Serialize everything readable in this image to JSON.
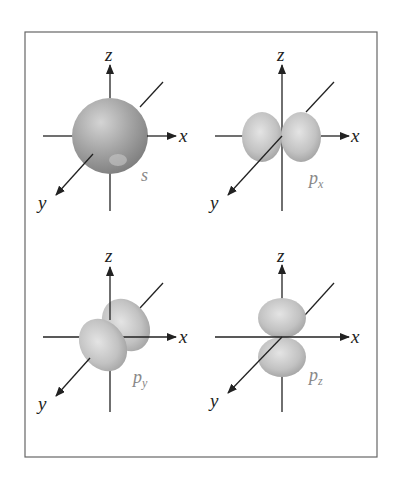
{
  "figure": {
    "type": "atomic-orbitals-diagram",
    "frame_color": "#666666",
    "axis_color": "#222222",
    "orbital_fill": "#b4b4b4",
    "orbital_highlight": "#e2e2e2",
    "orbital_shadow": "#8a8a8a",
    "label_color": "#888888",
    "panels": [
      {
        "id": "s",
        "label": "s",
        "subscript": "",
        "axes": {
          "x": "x",
          "y": "y",
          "z": "z"
        }
      },
      {
        "id": "px",
        "label": "p",
        "subscript": "x",
        "axes": {
          "x": "x",
          "y": "y",
          "z": "z"
        }
      },
      {
        "id": "py",
        "label": "p",
        "subscript": "y",
        "axes": {
          "x": "x",
          "y": "y",
          "z": "z"
        }
      },
      {
        "id": "pz",
        "label": "p",
        "subscript": "z",
        "axes": {
          "x": "x",
          "y": "y",
          "z": "z"
        }
      }
    ]
  }
}
